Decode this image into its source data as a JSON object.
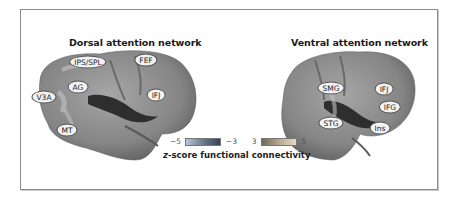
{
  "panels": [
    {
      "title": "Dorsal attention network",
      "regions": [
        {
          "label": "IPS/SPL"
        },
        {
          "label": "FEF"
        },
        {
          "label": "AG"
        },
        {
          "label": "V3A"
        },
        {
          "label": "IFJ"
        },
        {
          "label": "MT"
        }
      ]
    },
    {
      "title": "Ventral attention network",
      "regions": [
        {
          "label": "SMG"
        },
        {
          "label": "IFJ"
        },
        {
          "label": "IFG"
        },
        {
          "label": "STG"
        },
        {
          "label": "Ins"
        }
      ]
    }
  ],
  "legend": {
    "neg_min": "−5",
    "neg_max": "−3",
    "pos_min": "3",
    "pos_max": "5",
    "caption_var": "z",
    "caption_rest": "-score functional connectivity",
    "colors": {
      "neg_light": "#b8c6d6",
      "neg_dark": "#3a4254",
      "pos_dark": "#6e6a60",
      "pos_light": "#e4dcc4"
    }
  },
  "colors": {
    "brain_surface": "#8a8a8a",
    "sulci": "#3a3a3a",
    "frame_border": "#8c8c8c"
  }
}
